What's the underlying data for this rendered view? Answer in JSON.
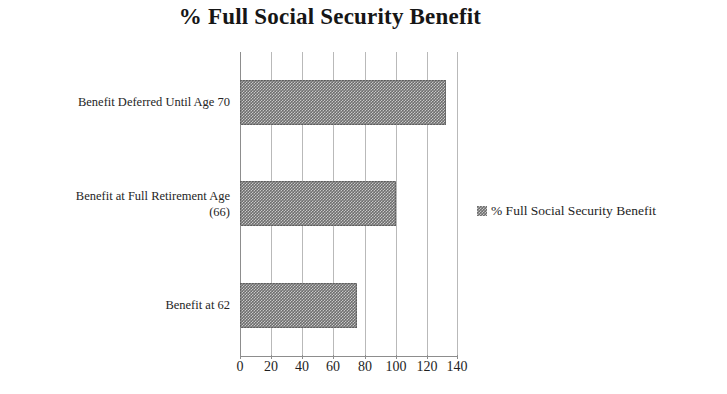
{
  "chart_data": {
    "type": "bar",
    "orientation": "horizontal",
    "title": "% Full Social Security Benefit",
    "xlabel": "",
    "ylabel": "",
    "xlim": [
      0,
      140
    ],
    "xticks": [
      0,
      20,
      40,
      60,
      80,
      100,
      120,
      140
    ],
    "xtick_labels": [
      "0",
      "20",
      "40",
      "60",
      "80",
      "100",
      "120",
      "140"
    ],
    "grid": true,
    "grid_axis": "x",
    "legend_position": "right",
    "categories": [
      "Benefit at 62",
      "Benefit at Full Retirement Age (66)",
      "Benefit Deferred Until Age 70"
    ],
    "series": [
      {
        "name": "% Full Social Security Benefit",
        "values": [
          75,
          100,
          132
        ],
        "color": "#6e6e6e"
      }
    ],
    "bars": [
      {
        "label_line1": "Benefit Deferred Until Age 70",
        "label_line2": "",
        "value": 132
      },
      {
        "label_line1": "Benefit at Full Retirement Age",
        "label_line2": "(66)",
        "value": 100
      },
      {
        "label_line1": "Benefit at 62",
        "label_line2": "",
        "value": 75
      }
    ],
    "legend": [
      {
        "label": "% Full Social Security Benefit",
        "swatch_name": "legend-swatch",
        "color": "#6e6e6e"
      }
    ]
  }
}
